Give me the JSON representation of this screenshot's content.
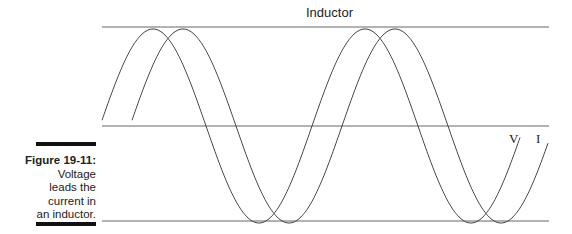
{
  "title": "Inductor",
  "caption": {
    "figure_label": "Figure 19-11:",
    "text_lines": [
      "Voltage",
      "leads the",
      "current in",
      "an inductor."
    ]
  },
  "labels": {
    "voltage": "V",
    "current": "I"
  },
  "colors": {
    "line": "#555555",
    "curve": "#444444",
    "bar": "#111111"
  },
  "geometry": {
    "top_line_y": 27,
    "mid_line_y": 126,
    "bottom_line_y": 221,
    "x_start": 102,
    "x_end": 549,
    "period": 212,
    "amplitude": 97,
    "voltage_start_x": 102,
    "current_start_x": 132,
    "phase_shift_px": 30
  }
}
